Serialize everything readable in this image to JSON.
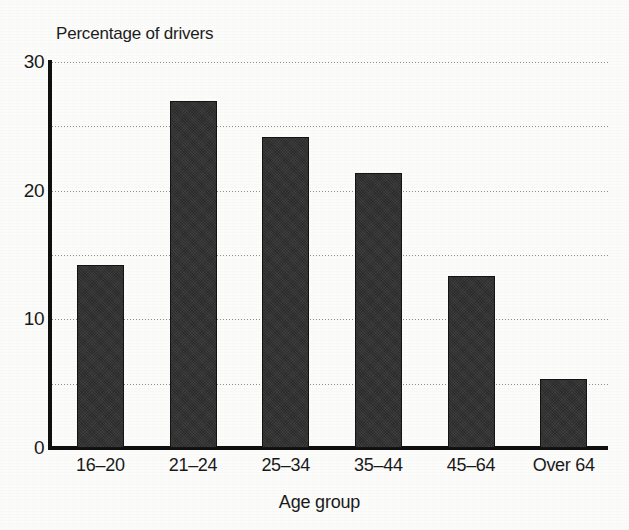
{
  "chart_data": {
    "type": "bar",
    "title": "Percentage of drivers",
    "xlabel": "Age group",
    "ylabel": "",
    "categories": [
      "16–20",
      "21–24",
      "25–34",
      "35–44",
      "45–64",
      "Over 64"
    ],
    "values": [
      14.2,
      27.0,
      24.2,
      21.4,
      13.4,
      5.4
    ],
    "ylim": [
      0,
      30
    ],
    "y_tick_labels": [
      "0",
      "10",
      "20",
      "30"
    ],
    "y_tick_values": [
      0,
      10,
      20,
      30
    ],
    "gridline_values": [
      5,
      10,
      15,
      20,
      25,
      30
    ],
    "grid": true,
    "legend": false,
    "legend_position": "none",
    "bar_color": "#2f2f2f",
    "axis_color": "#101010",
    "gridline_color": "#8d8d8d",
    "background_color": "#fdfdfc"
  }
}
